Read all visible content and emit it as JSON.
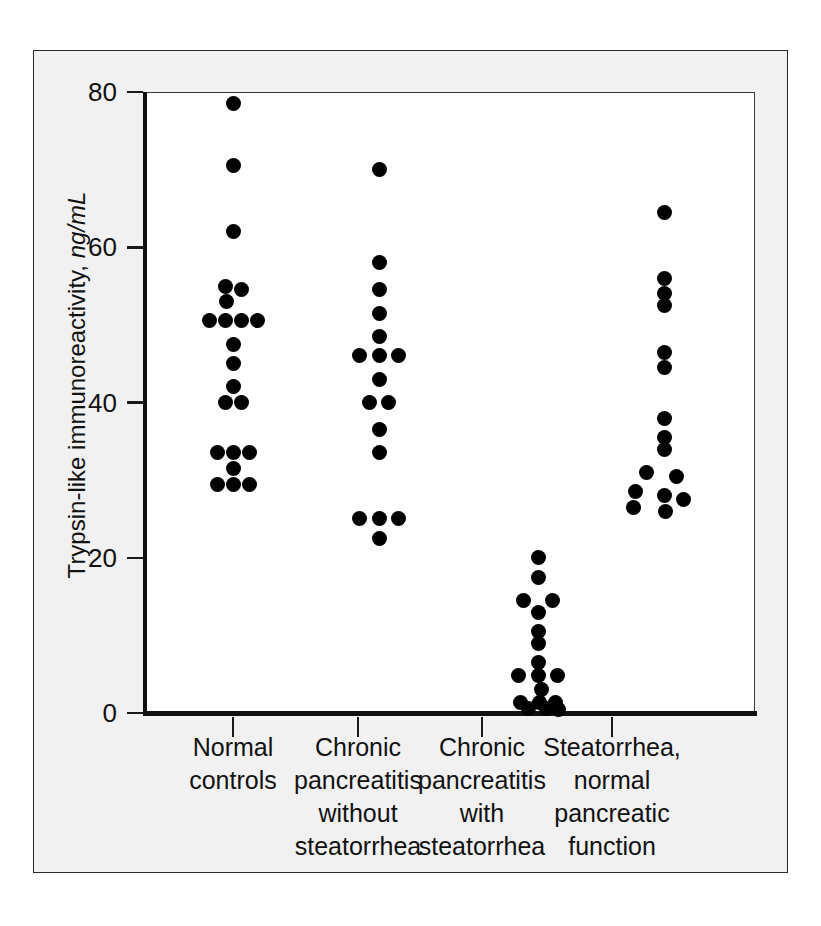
{
  "figure": {
    "background_color": "#f1f1f1",
    "plot_background_color": "#ffffff",
    "dot_color": "#000000",
    "axis_color": "#111111"
  },
  "axes": {
    "y_title_main": "Trypsin-like immunoreactivity, ",
    "y_title_units": "ng/mL",
    "y_ticks": [
      "80",
      "60",
      "40",
      "20",
      "0"
    ],
    "y_tick_values": [
      80,
      60,
      40,
      20,
      0
    ]
  },
  "categories": [
    {
      "lines": [
        "Normal",
        "controls"
      ]
    },
    {
      "lines": [
        "Chronic",
        "pancreatitis",
        "without",
        "steatorrhea"
      ]
    },
    {
      "lines": [
        "Chronic",
        "pancreatitis",
        "with",
        "steatorrhea"
      ]
    },
    {
      "lines": [
        "Steatorrhea,",
        "normal",
        "pancreatic",
        "function"
      ]
    }
  ],
  "chart_data": {
    "type": "scatter",
    "title": "",
    "xlabel": "",
    "ylabel": "Trypsin-like immunoreactivity, ng/mL",
    "ylim": [
      0,
      80
    ],
    "yticks": [
      0,
      20,
      40,
      60,
      80
    ],
    "grid": false,
    "legend": "none",
    "categories": [
      "Normal controls",
      "Chronic pancreatitis without steatorrhea",
      "Chronic pancreatitis with steatorrhea",
      "Steatorrhea, normal pancreatic function"
    ],
    "series": [
      {
        "name": "Normal controls",
        "n": 22,
        "points": [
          {
            "value": 78.5,
            "offset": 0
          },
          {
            "value": 70.5,
            "offset": 0
          },
          {
            "value": 62.0,
            "offset": 0
          },
          {
            "value": 55.0,
            "offset": -0.5
          },
          {
            "value": 54.5,
            "offset": 0.5
          },
          {
            "value": 53.0,
            "offset": -0.4
          },
          {
            "value": 50.5,
            "offset": -1.5
          },
          {
            "value": 50.5,
            "offset": -0.5
          },
          {
            "value": 50.5,
            "offset": 0.5
          },
          {
            "value": 50.5,
            "offset": 1.5
          },
          {
            "value": 47.5,
            "offset": 0
          },
          {
            "value": 45.0,
            "offset": 0
          },
          {
            "value": 42.0,
            "offset": 0
          },
          {
            "value": 40.0,
            "offset": -0.5
          },
          {
            "value": 40.0,
            "offset": 0.5
          },
          {
            "value": 33.5,
            "offset": -1.0
          },
          {
            "value": 33.5,
            "offset": 0
          },
          {
            "value": 33.5,
            "offset": 1.0
          },
          {
            "value": 31.5,
            "offset": 0
          },
          {
            "value": 29.5,
            "offset": -1.0
          },
          {
            "value": 29.5,
            "offset": 0
          },
          {
            "value": 29.5,
            "offset": 1.0
          }
        ]
      },
      {
        "name": "Chronic pancreatitis without steatorrhea",
        "n": 17,
        "points": [
          {
            "value": 70.0,
            "offset": 0
          },
          {
            "value": 58.0,
            "offset": 0
          },
          {
            "value": 54.5,
            "offset": 0
          },
          {
            "value": 51.5,
            "offset": 0
          },
          {
            "value": 48.5,
            "offset": 0
          },
          {
            "value": 46.0,
            "offset": -1.2
          },
          {
            "value": 46.0,
            "offset": 0
          },
          {
            "value": 46.0,
            "offset": 1.2
          },
          {
            "value": 43.0,
            "offset": 0
          },
          {
            "value": 40.0,
            "offset": -0.6
          },
          {
            "value": 40.0,
            "offset": 0.6
          },
          {
            "value": 36.5,
            "offset": 0
          },
          {
            "value": 33.5,
            "offset": 0
          },
          {
            "value": 25.0,
            "offset": -1.2
          },
          {
            "value": 25.0,
            "offset": 0
          },
          {
            "value": 25.0,
            "offset": 1.2
          },
          {
            "value": 22.5,
            "offset": 0
          }
        ]
      },
      {
        "name": "Chronic pancreatitis with steatorrhea",
        "n": 18,
        "points": [
          {
            "value": 20.0,
            "offset": 0
          },
          {
            "value": 17.5,
            "offset": 0
          },
          {
            "value": 14.5,
            "offset": -0.9
          },
          {
            "value": 14.5,
            "offset": 0.9
          },
          {
            "value": 13.0,
            "offset": 0
          },
          {
            "value": 10.5,
            "offset": 0
          },
          {
            "value": 9.0,
            "offset": 0
          },
          {
            "value": 6.5,
            "offset": 0
          },
          {
            "value": 4.8,
            "offset": -1.2
          },
          {
            "value": 4.8,
            "offset": 0
          },
          {
            "value": 4.8,
            "offset": 1.2
          },
          {
            "value": 3.0,
            "offset": 0.2
          },
          {
            "value": 1.4,
            "offset": -1.1
          },
          {
            "value": 1.4,
            "offset": 0.1
          },
          {
            "value": 1.4,
            "offset": 1.1
          },
          {
            "value": 0.6,
            "offset": -0.6
          },
          {
            "value": 0.6,
            "offset": 0.5
          },
          {
            "value": 0.4,
            "offset": 1.3
          }
        ]
      },
      {
        "name": "Steatorrhea, normal pancreatic function",
        "n": 16,
        "points": [
          {
            "value": 64.5,
            "offset": 0
          },
          {
            "value": 56.0,
            "offset": 0
          },
          {
            "value": 54.0,
            "offset": 0
          },
          {
            "value": 52.5,
            "offset": 0
          },
          {
            "value": 46.5,
            "offset": 0
          },
          {
            "value": 44.5,
            "offset": 0
          },
          {
            "value": 38.0,
            "offset": 0
          },
          {
            "value": 35.5,
            "offset": 0
          },
          {
            "value": 34.0,
            "offset": 0
          },
          {
            "value": 31.0,
            "offset": -1.1
          },
          {
            "value": 30.5,
            "offset": 0.8
          },
          {
            "value": 28.5,
            "offset": -1.8
          },
          {
            "value": 28.0,
            "offset": 0
          },
          {
            "value": 27.5,
            "offset": 1.2
          },
          {
            "value": 26.0,
            "offset": 0.1
          },
          {
            "value": 26.5,
            "offset": -1.9
          }
        ]
      }
    ]
  }
}
